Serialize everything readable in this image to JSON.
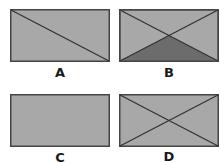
{
  "colors": {
    "fill": "#a8a8a8",
    "stroke": "#454545",
    "shade": "#6c6c6c",
    "background": "#ffffff"
  },
  "figures": [
    {
      "id": "A",
      "label": "A",
      "description": "rectangle with one diagonal from top-left to bottom-right"
    },
    {
      "id": "B",
      "label": "B",
      "description": "rectangle with both diagonals, bottom triangle shaded dark"
    },
    {
      "id": "C",
      "label": "C",
      "description": "plain rectangle, no lines"
    },
    {
      "id": "D",
      "label": "D",
      "description": "rectangle with both diagonals"
    }
  ]
}
